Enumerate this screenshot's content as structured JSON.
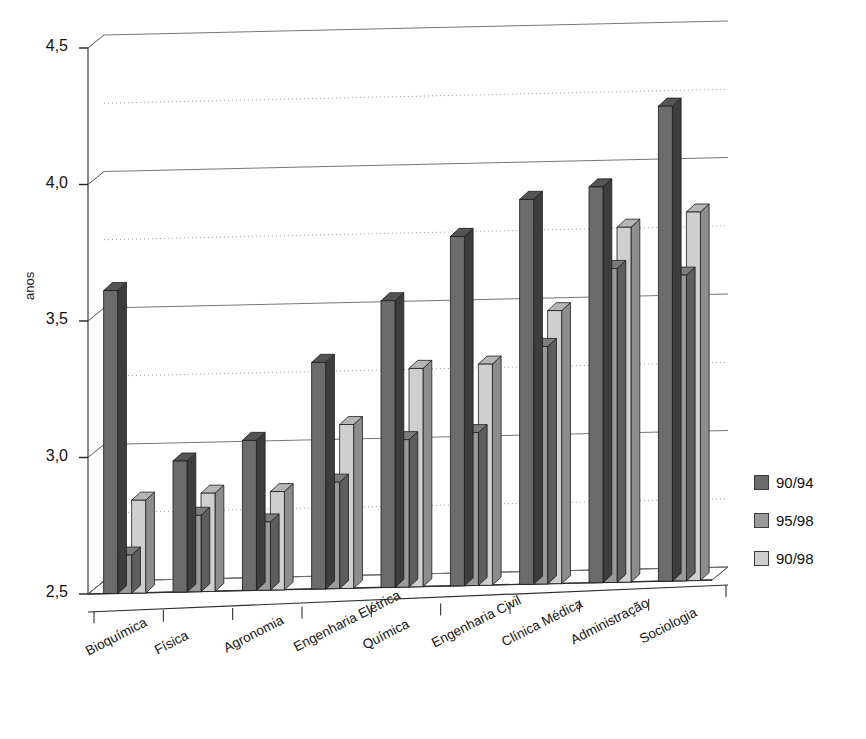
{
  "title": "",
  "chart_data": {
    "type": "bar",
    "title": "",
    "subtitle": "",
    "xlabel": "",
    "ylabel": "anos",
    "ylim": [
      2.5,
      4.5
    ],
    "ytick_labels": [
      "4,5",
      "4,0",
      "3,5",
      "3,0",
      "2,5"
    ],
    "ytick_values": [
      4.5,
      4.0,
      3.5,
      3.0,
      2.5
    ],
    "minor_gridlines": [
      4.25,
      3.75,
      3.25,
      2.75
    ],
    "grid": true,
    "legend_position": "right",
    "style": "3d-column",
    "categories": [
      "Bioquímica",
      "Física",
      "Agronomia",
      "Engenharia Elétrica",
      "Química",
      "Engenharia Civil",
      "Clínica Médica",
      "Administração",
      "Sociologia"
    ],
    "series": [
      {
        "name": "90/94",
        "color": "#6b6b6b",
        "side_color": "#3d3d3d",
        "top_color": "#545454",
        "values": [
          3.61,
          2.98,
          3.05,
          3.33,
          3.55,
          3.78,
          3.91,
          3.95,
          4.24
        ]
      },
      {
        "name": "95/98",
        "color": "#9a9a9a",
        "side_color": "#5e5e5e",
        "top_color": "#7d7d7d",
        "values": [
          2.64,
          2.78,
          2.75,
          2.89,
          3.04,
          3.06,
          3.37,
          3.65,
          3.62
        ]
      },
      {
        "name": "90/98",
        "color": "#cfcfcf",
        "side_color": "#8d8d8d",
        "top_color": "#b5b5b5",
        "values": [
          2.84,
          2.86,
          2.86,
          3.1,
          3.3,
          3.31,
          3.5,
          3.8,
          3.85
        ]
      }
    ]
  },
  "legend": {
    "items": [
      {
        "label": "90/94",
        "color": "#6b6b6b"
      },
      {
        "label": "95/98",
        "color": "#9a9a9a"
      },
      {
        "label": "90/98",
        "color": "#cfcfcf"
      }
    ]
  }
}
